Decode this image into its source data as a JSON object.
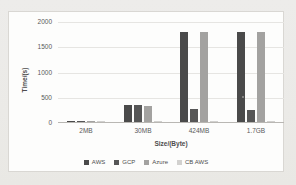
{
  "chart_data": {
    "type": "bar",
    "title": "",
    "xlabel": "Size/(Byte)",
    "ylabel": "Time/(s)",
    "categories": [
      "2MB",
      "30MB",
      "424MB",
      "1.7GB"
    ],
    "series": [
      {
        "name": "AWS",
        "color": "#4a4a4a",
        "values": [
          25,
          330,
          1785,
          1790
        ]
      },
      {
        "name": "GCP",
        "color": "#565656",
        "values": [
          25,
          345,
          250,
          235
        ]
      },
      {
        "name": "Azure",
        "color": "#a3a2a0",
        "values": [
          15,
          310,
          1785,
          1780
        ]
      },
      {
        "name": "CB AWS",
        "color": "#d2d1cf",
        "values": [
          8,
          12,
          12,
          12
        ]
      }
    ],
    "ylim": [
      0,
      2000
    ],
    "yticks": [
      0,
      500,
      1000,
      1500,
      2000
    ],
    "grid": true,
    "legend_position": "bottom"
  }
}
